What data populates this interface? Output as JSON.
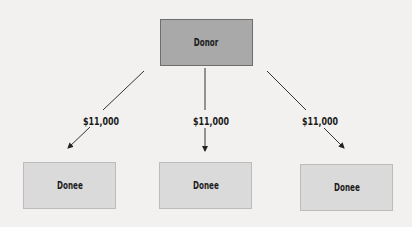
{
  "diagram": {
    "donor": {
      "label": "Donor",
      "fill": "#a9a9a9"
    },
    "gift_amount": "$11,000",
    "donees": [
      {
        "label": "Donee",
        "fill": "#dadada"
      },
      {
        "label": "Donee",
        "fill": "#dadada"
      },
      {
        "label": "Donee",
        "fill": "#dadada"
      }
    ],
    "edges": [
      {
        "from": "Donor",
        "to": "Donee 1",
        "label": "$11,000"
      },
      {
        "from": "Donor",
        "to": "Donee 2",
        "label": "$11,000"
      },
      {
        "from": "Donor",
        "to": "Donee 3",
        "label": "$11,000"
      }
    ]
  }
}
